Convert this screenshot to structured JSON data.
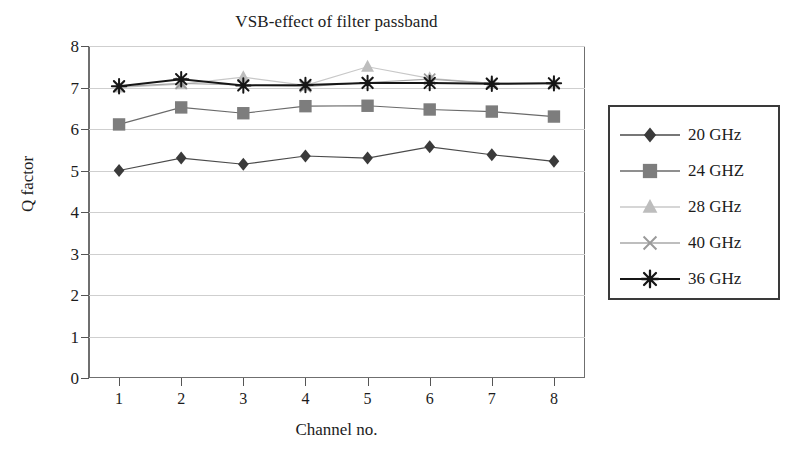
{
  "chart_data": {
    "type": "line",
    "title": "VSB-effect of filter passband",
    "xlabel": "Channel no.",
    "ylabel": "Q factor",
    "x": [
      1,
      2,
      3,
      4,
      5,
      6,
      7,
      8
    ],
    "categories": [
      "1",
      "2",
      "3",
      "4",
      "5",
      "6",
      "7",
      "8"
    ],
    "xtick_labels": [
      "1",
      "2",
      "3",
      "4",
      "5",
      "6",
      "7",
      "8"
    ],
    "ytick_labels": [
      "0",
      "1",
      "2",
      "3",
      "4",
      "5",
      "6",
      "7",
      "8"
    ],
    "ytick_values": [
      0,
      1,
      2,
      3,
      4,
      5,
      6,
      7,
      8
    ],
    "ylim": [
      0,
      8
    ],
    "xlim": [
      0.5,
      8.5
    ],
    "grid": "horizontal",
    "legend_position": "right-outside",
    "series": [
      {
        "name": "20 GHz",
        "marker": "diamond",
        "color": "#3a3a3a",
        "line_color": "#4a4a4a",
        "values": [
          5.0,
          5.3,
          5.15,
          5.35,
          5.3,
          5.57,
          5.38,
          5.22
        ]
      },
      {
        "name": "24 GHZ",
        "marker": "square",
        "color": "#7d7d7d",
        "line_color": "#6a6a6a",
        "values": [
          6.11,
          6.52,
          6.38,
          6.55,
          6.56,
          6.47,
          6.42,
          6.3
        ]
      },
      {
        "name": "28 GHz",
        "marker": "triangle",
        "color": "#bdbdbd",
        "line_color": "#c8c8c8",
        "values": [
          7.0,
          7.08,
          7.25,
          7.05,
          7.5,
          7.22,
          7.1,
          7.1
        ]
      },
      {
        "name": "40 GHz",
        "marker": "x",
        "color": "#9a9a9a",
        "line_color": "#a8a8a8",
        "values": [
          7.02,
          7.1,
          7.06,
          7.02,
          7.12,
          7.2,
          7.1,
          7.1
        ]
      },
      {
        "name": "36 GHz",
        "marker": "asterisk",
        "color": "#161616",
        "line_color": "#161616",
        "values": [
          7.03,
          7.2,
          7.05,
          7.06,
          7.11,
          7.11,
          7.09,
          7.1
        ]
      }
    ]
  },
  "legend": {
    "items": [
      {
        "label": "20 GHz"
      },
      {
        "label": "24 GHZ"
      },
      {
        "label": "28 GHz"
      },
      {
        "label": "40 GHz"
      },
      {
        "label": "36 GHz"
      }
    ]
  }
}
